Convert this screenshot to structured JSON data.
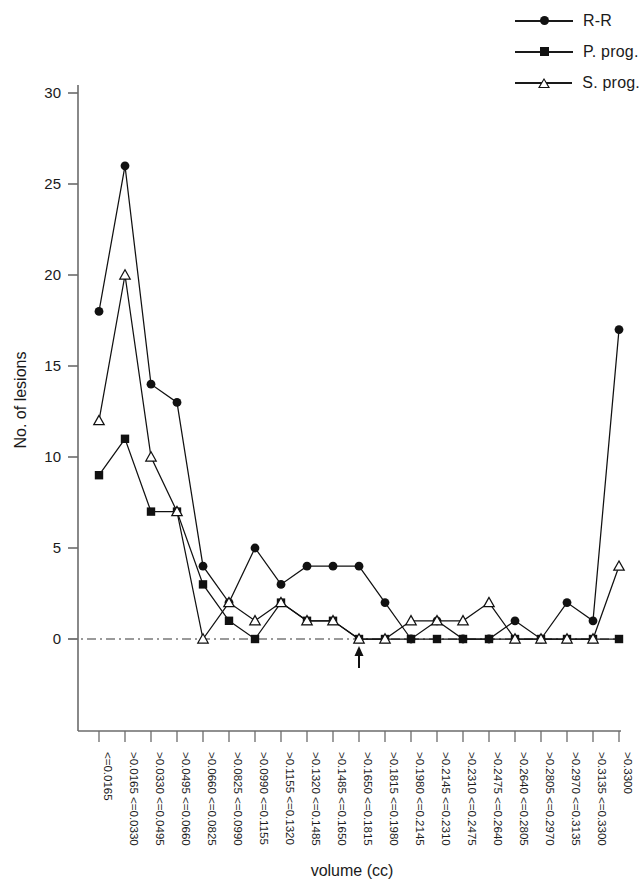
{
  "chart_data": {
    "type": "line",
    "title": "",
    "xlabel": "volume (cc)",
    "ylabel": "No. of lesions",
    "ylim": [
      0,
      30
    ],
    "yticks": [
      0,
      5,
      10,
      15,
      20,
      25,
      30
    ],
    "grid": false,
    "zero_line": true,
    "legend_position": "top-right",
    "annotation": {
      "marker": "up-arrow",
      "at_category": ">0.1650 <=0.1815",
      "at_index": 10
    },
    "categories": [
      "<=0.0165",
      ">0.0165 <=0.0330",
      ">0.0330 <=0.0495",
      ">0.0495 <=0.0660",
      ">0.0660 <=0.0825",
      ">0.0825 <=0.0990",
      ">0.0990 <=0.1155",
      ">0.1155 <=0.1320",
      ">0.1320 <=0.1485",
      ">0.1485 <=0.1650",
      ">0.1650 <=0.1815",
      ">0.1815 <=0.1980",
      ">0.1980 <=0.2145",
      ">0.2145 <=0.2310",
      ">0.2310 <=0.2475",
      ">0.2475 <=0.2640",
      ">0.2640 <=0.2805",
      ">0.2805 <=0.2970",
      ">0.2970 <=0.3135",
      ">0.3135 <=0.3300",
      ">0.3300"
    ],
    "series": [
      {
        "name": "R-R",
        "marker": "filled-circle",
        "color": "#111111",
        "values": [
          18,
          26,
          14,
          13,
          4,
          2,
          5,
          3,
          4,
          4,
          4,
          2,
          0,
          1,
          0,
          0,
          1,
          0,
          2,
          1,
          17
        ]
      },
      {
        "name": "P. prog.",
        "marker": "filled-square",
        "color": "#111111",
        "values": [
          9,
          11,
          7,
          7,
          3,
          1,
          0,
          2,
          1,
          1,
          0,
          0,
          0,
          0,
          0,
          0,
          0,
          0,
          0,
          0,
          0
        ]
      },
      {
        "name": "S. prog.",
        "marker": "open-triangle",
        "color": "#111111",
        "values": [
          12,
          20,
          10,
          7,
          0,
          2,
          1,
          2,
          1,
          1,
          0,
          0,
          1,
          1,
          1,
          2,
          0,
          0,
          0,
          0,
          4
        ]
      }
    ]
  },
  "legend": {
    "items": [
      {
        "label": "R-R",
        "marker": "filled-circle"
      },
      {
        "label": "P. prog.",
        "marker": "filled-square"
      },
      {
        "label": "S. prog.",
        "marker": "open-triangle"
      }
    ]
  },
  "axes": {
    "y_title": "No. of lesions",
    "x_title": "volume (cc)"
  }
}
